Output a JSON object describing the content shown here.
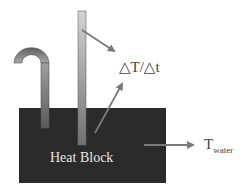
{
  "diagram": {
    "block_label": "Heat Block",
    "rate_label": "△T/△t",
    "twater_main": "T",
    "twater_sub": "water"
  },
  "colors": {
    "block": "#2b2b2b",
    "arrow": "#7a7a7a",
    "tube_dark": "#6a6a6a",
    "tube_light": "#d0d0d0"
  }
}
